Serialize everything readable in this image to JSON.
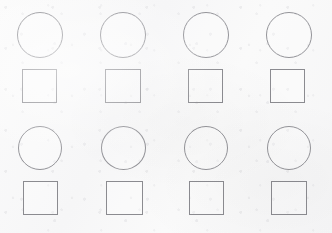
{
  "figure": {
    "type": "shape-grid",
    "canvas": {
      "width": 332,
      "height": 233
    },
    "background_color": "#f8f8f8",
    "columns": 4,
    "rows": 4,
    "row_shape_sequence": [
      "circle",
      "square",
      "circle",
      "square"
    ],
    "stroke": {
      "circle_color": "#939398",
      "square_color": "#8b8b90",
      "width_px": 1,
      "fill": "none"
    },
    "shapes": [
      {
        "id": "r1c1",
        "row": 1,
        "col": 1,
        "kind": "circle",
        "shape_label": "circle",
        "x": 17,
        "y": 12,
        "width": 46,
        "height": 46
      },
      {
        "id": "r1c2",
        "row": 1,
        "col": 2,
        "kind": "circle",
        "shape_label": "circle",
        "x": 100,
        "y": 12,
        "width": 46,
        "height": 46
      },
      {
        "id": "r1c3",
        "row": 1,
        "col": 3,
        "kind": "circle",
        "shape_label": "circle",
        "x": 183,
        "y": 12,
        "width": 46,
        "height": 46
      },
      {
        "id": "r1c4",
        "row": 1,
        "col": 4,
        "kind": "circle",
        "shape_label": "circle",
        "x": 266,
        "y": 12,
        "width": 46,
        "height": 46
      },
      {
        "id": "r2c1",
        "row": 2,
        "col": 1,
        "kind": "square",
        "shape_label": "square",
        "x": 22,
        "y": 69,
        "width": 35,
        "height": 34
      },
      {
        "id": "r2c2",
        "row": 2,
        "col": 2,
        "kind": "square",
        "shape_label": "square",
        "x": 105,
        "y": 69,
        "width": 36,
        "height": 34
      },
      {
        "id": "r2c3",
        "row": 2,
        "col": 3,
        "kind": "square",
        "shape_label": "square",
        "x": 188,
        "y": 69,
        "width": 35,
        "height": 34
      },
      {
        "id": "r2c4",
        "row": 2,
        "col": 4,
        "kind": "square",
        "shape_label": "square",
        "x": 270,
        "y": 69,
        "width": 35,
        "height": 34
      },
      {
        "id": "r3c1",
        "row": 3,
        "col": 1,
        "kind": "circle",
        "shape_label": "circle",
        "x": 18,
        "y": 126,
        "width": 44,
        "height": 44
      },
      {
        "id": "r3c2",
        "row": 3,
        "col": 2,
        "kind": "circle",
        "shape_label": "circle",
        "x": 101,
        "y": 126,
        "width": 45,
        "height": 44
      },
      {
        "id": "r3c3",
        "row": 3,
        "col": 3,
        "kind": "circle",
        "shape_label": "circle",
        "x": 184,
        "y": 126,
        "width": 44,
        "height": 44
      },
      {
        "id": "r3c4",
        "row": 3,
        "col": 4,
        "kind": "circle",
        "shape_label": "circle",
        "x": 267,
        "y": 126,
        "width": 44,
        "height": 44
      },
      {
        "id": "r4c1",
        "row": 4,
        "col": 1,
        "kind": "square",
        "shape_label": "square",
        "x": 23,
        "y": 181,
        "width": 35,
        "height": 34
      },
      {
        "id": "r4c2",
        "row": 4,
        "col": 2,
        "kind": "square",
        "shape_label": "square",
        "x": 106,
        "y": 181,
        "width": 37,
        "height": 34
      },
      {
        "id": "r4c3",
        "row": 4,
        "col": 3,
        "kind": "square",
        "shape_label": "square",
        "x": 189,
        "y": 181,
        "width": 35,
        "height": 34
      },
      {
        "id": "r4c4",
        "row": 4,
        "col": 4,
        "kind": "square",
        "shape_label": "square",
        "x": 271,
        "y": 181,
        "width": 36,
        "height": 34
      }
    ],
    "counts": {
      "circles": 8,
      "squares": 8,
      "total": 16
    }
  }
}
